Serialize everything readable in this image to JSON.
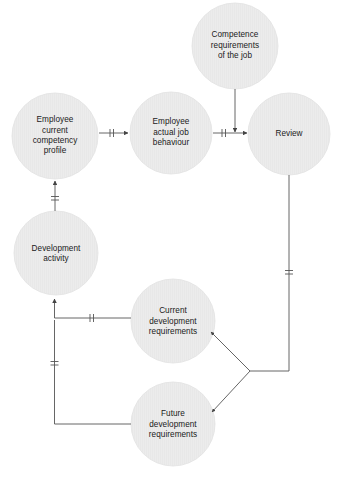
{
  "diagram": {
    "type": "cycle-flow-diagram",
    "title": "",
    "canvas": {
      "width": 340,
      "height": 480,
      "background": "#ffffff"
    },
    "style": {
      "node_fill": "#ebebeb",
      "node_stroke": "#e0e0e0",
      "connector_color": "#555555",
      "text_color": "#1a1a1a"
    },
    "nodes": [
      {
        "id": "competence-requirements",
        "label": "Competence\nrequirements\nof the job",
        "cx": 235,
        "cy": 46,
        "r": 43
      },
      {
        "id": "employee-current-competency-profile",
        "label": "Employee\ncurrent\ncompetency\nprofile",
        "cx": 55,
        "cy": 136,
        "r": 43
      },
      {
        "id": "employee-actual-job-behaviour",
        "label": "Employee\nactual job\nbehaviour",
        "cx": 171,
        "cy": 133,
        "r": 41
      },
      {
        "id": "review",
        "label": "Review",
        "cx": 289,
        "cy": 134,
        "r": 41
      },
      {
        "id": "development-activity",
        "label": "Development\nactivity",
        "cx": 56,
        "cy": 253,
        "r": 42
      },
      {
        "id": "current-development-requirements",
        "label": "Current\ndevelopment\nrequirements",
        "cx": 173,
        "cy": 321,
        "r": 42
      },
      {
        "id": "future-development-requirements",
        "label": "Future\ndevelopment\nrequirements",
        "cx": 173,
        "cy": 424,
        "r": 42
      }
    ],
    "connectors": [
      {
        "id": "profile-to-behaviour",
        "from": "employee-current-competency-profile",
        "to": "employee-actual-job-behaviour",
        "arrowhead": true,
        "tick_marks": 2
      },
      {
        "id": "behaviour-to-review",
        "from": "employee-actual-job-behaviour",
        "to": "review",
        "arrowhead": true,
        "tick_marks": 2
      },
      {
        "id": "competence-to-review-input",
        "from": "competence-requirements",
        "to": "review",
        "arrowhead": true,
        "tick_marks": 0
      },
      {
        "id": "development-to-profile",
        "from": "development-activity",
        "to": "employee-current-competency-profile",
        "arrowhead": true,
        "tick_marks": 2
      },
      {
        "id": "current-requirements-to-development",
        "from": "current-development-requirements",
        "to": "development-activity",
        "arrowhead": true,
        "tick_marks": 2
      },
      {
        "id": "future-requirements-to-development",
        "from": "future-development-requirements",
        "to": "development-activity",
        "arrowhead": true,
        "tick_marks": 2
      },
      {
        "id": "review-to-current-requirements",
        "from": "review",
        "to": "current-development-requirements",
        "arrowhead": true,
        "tick_marks": 2
      },
      {
        "id": "review-to-future-requirements",
        "from": "review",
        "to": "future-development-requirements",
        "arrowhead": true,
        "tick_marks": 0
      }
    ]
  }
}
